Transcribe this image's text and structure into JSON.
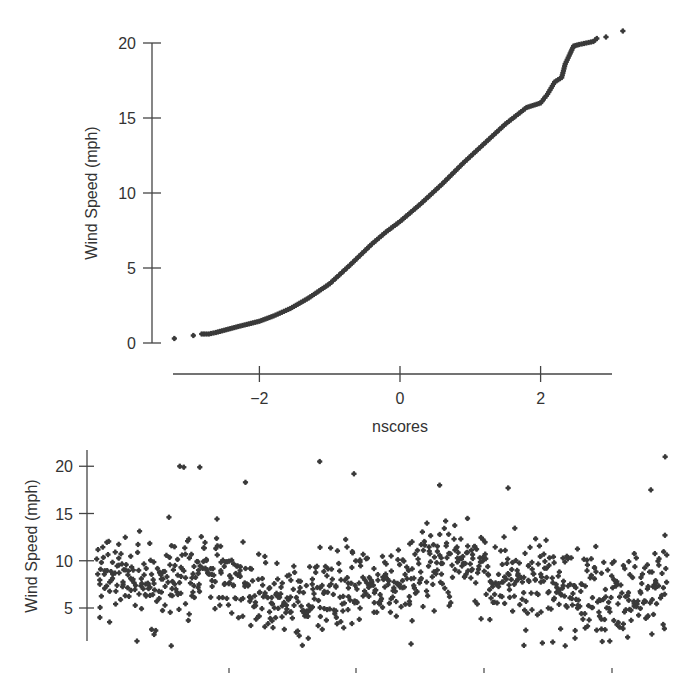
{
  "figure": {
    "ink_color": "#3a3a3a",
    "axis_color": "#444444",
    "background": "#ffffff"
  },
  "chart_data": [
    {
      "id": "qq_plot",
      "type": "scatter",
      "title": "",
      "xlabel": "nscores",
      "ylabel": "Wind Speed (mph)",
      "xlim": [
        -3.25,
        3.1
      ],
      "ylim": [
        0,
        20
      ],
      "x_ticks": [
        -2,
        0,
        2
      ],
      "x_tick_labels": [
        "−2",
        "0",
        "2"
      ],
      "y_ticks": [
        0,
        5,
        10,
        15,
        20
      ],
      "y_tick_labels": [
        "0",
        "5",
        "10",
        "15",
        "20"
      ],
      "grid": false,
      "legend": null,
      "marker": "plus-dot",
      "description": "Normal probability plot of wind speed; curve bends upward (right-skewed)",
      "curve_points": [
        [
          -3.21,
          0.3
        ],
        [
          -2.94,
          0.5
        ],
        [
          -2.82,
          0.6
        ],
        [
          -2.72,
          0.6
        ],
        [
          -2.62,
          0.7
        ],
        [
          -2.5,
          0.85
        ],
        [
          -2.3,
          1.1
        ],
        [
          -2.0,
          1.45
        ],
        [
          -1.8,
          1.8
        ],
        [
          -1.56,
          2.3
        ],
        [
          -1.3,
          3.0
        ],
        [
          -1.0,
          3.95
        ],
        [
          -0.71,
          5.2
        ],
        [
          -0.4,
          6.6
        ],
        [
          -0.2,
          7.4
        ],
        [
          0.0,
          8.1
        ],
        [
          0.3,
          9.3
        ],
        [
          0.6,
          10.6
        ],
        [
          0.9,
          12.0
        ],
        [
          1.2,
          13.3
        ],
        [
          1.5,
          14.6
        ],
        [
          1.8,
          15.7
        ],
        [
          2.0,
          16.0
        ],
        [
          2.1,
          16.6
        ],
        [
          2.2,
          17.4
        ],
        [
          2.3,
          17.7
        ],
        [
          2.35,
          18.6
        ],
        [
          2.42,
          19.3
        ],
        [
          2.47,
          19.8
        ],
        [
          2.55,
          19.9
        ],
        [
          2.65,
          20.0
        ],
        [
          2.75,
          20.1
        ],
        [
          2.8,
          20.3
        ],
        [
          2.93,
          20.4
        ],
        [
          3.17,
          20.8
        ]
      ],
      "n_points": 1000
    },
    {
      "id": "time_plot",
      "type": "scatter",
      "title": "",
      "xlabel": "",
      "ylabel": "Wind Speed (mph)",
      "xlim": [
        0,
        1
      ],
      "ylim": [
        0.5,
        22
      ],
      "x_ticks_px_fraction": [
        0.253,
        0.5,
        0.748,
        0.995
      ],
      "x_tick_labels": [
        "",
        "",
        "",
        ""
      ],
      "y_ticks": [
        5,
        10,
        15,
        20
      ],
      "y_tick_labels": [
        "5",
        "10",
        "15",
        "20"
      ],
      "grid": false,
      "legend": null,
      "description": "Wind speed plotted over time (sequence order); values mostly 2-15 mph with occasional highs near 20",
      "generator": {
        "seed": 7,
        "count": 900,
        "median": 7.6,
        "spread": 3.2,
        "min": 1.0,
        "max": 18.5
      },
      "notable_points": [
        [
          0.145,
          20.0
        ],
        [
          0.152,
          19.9
        ],
        [
          0.18,
          19.9
        ],
        [
          0.39,
          20.5
        ],
        [
          0.45,
          19.2
        ],
        [
          0.995,
          21.0
        ],
        [
          0.97,
          17.5
        ],
        [
          0.26,
          18.3
        ],
        [
          0.72,
          17.7
        ],
        [
          0.6,
          18.0
        ],
        [
          0.005,
          4.0
        ],
        [
          0.07,
          1.5
        ],
        [
          0.13,
          1.0
        ],
        [
          0.1,
          2.2
        ],
        [
          0.37,
          1.8
        ],
        [
          0.55,
          1.2
        ],
        [
          0.78,
          1.3
        ],
        [
          0.82,
          1.0
        ]
      ]
    }
  ]
}
